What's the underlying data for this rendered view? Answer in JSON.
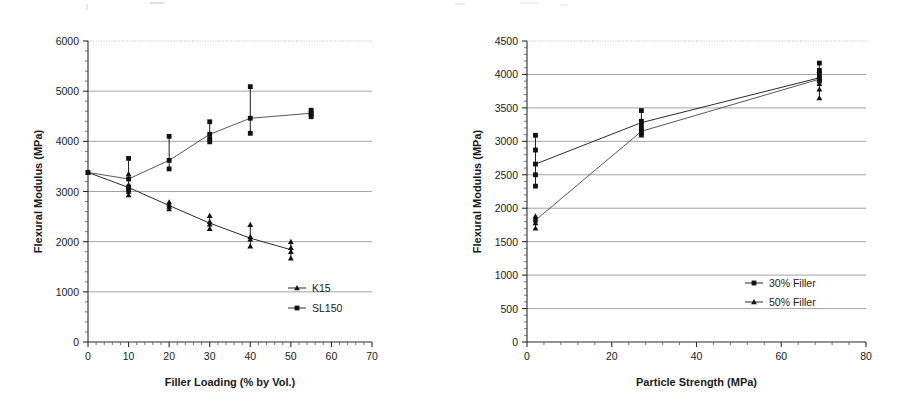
{
  "figure": {
    "panel_count": 2,
    "background": "#ffffff",
    "ink_color": "#111111",
    "grid_color": "#9a9a9a"
  },
  "chart_data": [
    {
      "id": "left",
      "type": "scatter",
      "title": "",
      "xlabel": "Filler Loading (% by Vol.)",
      "ylabel": "Flexural Modulus (MPa)",
      "xlim": [
        0,
        70
      ],
      "ylim": [
        0,
        6000
      ],
      "xticks": [
        0,
        10,
        20,
        30,
        40,
        50,
        60,
        70
      ],
      "yticks": [
        0,
        1000,
        2000,
        3000,
        4000,
        5000,
        6000
      ],
      "xtick_labels": [
        "0",
        "10",
        "20",
        "30",
        "40",
        "50",
        "60",
        "70"
      ],
      "ytick_labels": [
        "0",
        "1000",
        "2000",
        "3000",
        "4000",
        "5000",
        "6000"
      ],
      "x_minor_step": 2,
      "y_minor_step": 200,
      "grid": true,
      "legend_position": "bottom-right",
      "series": [
        {
          "name": "K15",
          "marker": "triangle",
          "mean_x": [
            0,
            10,
            20,
            30,
            40,
            50
          ],
          "mean_y": [
            3380,
            3080,
            2720,
            2370,
            2070,
            1840
          ],
          "points": [
            {
              "x": 0,
              "y": 3380
            },
            {
              "x": 10,
              "y": 3350
            },
            {
              "x": 10,
              "y": 3130
            },
            {
              "x": 10,
              "y": 3080
            },
            {
              "x": 10,
              "y": 3000
            },
            {
              "x": 10,
              "y": 2930
            },
            {
              "x": 20,
              "y": 2790
            },
            {
              "x": 20,
              "y": 2740
            },
            {
              "x": 20,
              "y": 2700
            },
            {
              "x": 20,
              "y": 2650
            },
            {
              "x": 30,
              "y": 2520
            },
            {
              "x": 30,
              "y": 2400
            },
            {
              "x": 30,
              "y": 2350
            },
            {
              "x": 30,
              "y": 2260
            },
            {
              "x": 40,
              "y": 2340
            },
            {
              "x": 40,
              "y": 2100
            },
            {
              "x": 40,
              "y": 2050
            },
            {
              "x": 40,
              "y": 1910
            },
            {
              "x": 50,
              "y": 2000
            },
            {
              "x": 50,
              "y": 1880
            },
            {
              "x": 50,
              "y": 1800
            },
            {
              "x": 50,
              "y": 1670
            }
          ],
          "error_bars": [
            {
              "x": 10,
              "low": 2930,
              "high": 3350
            },
            {
              "x": 20,
              "low": 2650,
              "high": 2790
            },
            {
              "x": 30,
              "low": 2260,
              "high": 2520
            },
            {
              "x": 40,
              "low": 1910,
              "high": 2340
            },
            {
              "x": 50,
              "low": 1670,
              "high": 2000
            }
          ]
        },
        {
          "name": "SL150",
          "marker": "square",
          "mean_x": [
            0,
            10,
            20,
            30,
            40,
            55
          ],
          "mean_y": [
            3380,
            3250,
            3620,
            4140,
            4460,
            4560
          ],
          "points": [
            {
              "x": 0,
              "y": 3380
            },
            {
              "x": 10,
              "y": 3660
            },
            {
              "x": 10,
              "y": 3250
            },
            {
              "x": 10,
              "y": 3090
            },
            {
              "x": 10,
              "y": 3040
            },
            {
              "x": 20,
              "y": 4100
            },
            {
              "x": 20,
              "y": 3620
            },
            {
              "x": 20,
              "y": 3450
            },
            {
              "x": 30,
              "y": 4390
            },
            {
              "x": 30,
              "y": 4140
            },
            {
              "x": 30,
              "y": 4050
            },
            {
              "x": 30,
              "y": 3990
            },
            {
              "x": 40,
              "y": 5090
            },
            {
              "x": 40,
              "y": 4460
            },
            {
              "x": 40,
              "y": 4160
            },
            {
              "x": 55,
              "y": 4620
            },
            {
              "x": 55,
              "y": 4570
            },
            {
              "x": 55,
              "y": 4530
            },
            {
              "x": 55,
              "y": 4490
            }
          ],
          "error_bars": [
            {
              "x": 10,
              "low": 3040,
              "high": 3660
            },
            {
              "x": 20,
              "low": 3450,
              "high": 4100
            },
            {
              "x": 30,
              "low": 3990,
              "high": 4390
            },
            {
              "x": 40,
              "low": 4160,
              "high": 5090
            },
            {
              "x": 55,
              "low": 4490,
              "high": 4620
            }
          ]
        }
      ],
      "legend": [
        {
          "label": "K15",
          "marker": "triangle"
        },
        {
          "label": "SL150",
          "marker": "square"
        }
      ]
    },
    {
      "id": "right",
      "type": "scatter",
      "title": "",
      "xlabel": "Particle Strength (MPa)",
      "ylabel": "Flexural Modulus (MPa)",
      "xlim": [
        0,
        80
      ],
      "ylim": [
        0,
        4500
      ],
      "xticks": [
        0,
        20,
        40,
        60,
        80
      ],
      "yticks": [
        0,
        500,
        1000,
        1500,
        2000,
        2500,
        3000,
        3500,
        4000,
        4500
      ],
      "xtick_labels": [
        "0",
        "20",
        "40",
        "60",
        "80"
      ],
      "ytick_labels": [
        "0",
        "500",
        "1000",
        "1500",
        "2000",
        "2500",
        "3000",
        "3500",
        "4000",
        "4500"
      ],
      "x_minor_step": 4,
      "y_minor_step": 100,
      "grid": true,
      "legend_position": "bottom-right",
      "series": [
        {
          "name": "30% Filler",
          "marker": "square",
          "mean_x": [
            2,
            27,
            69
          ],
          "mean_y": [
            2660,
            3280,
            3950
          ],
          "points": [
            {
              "x": 2,
              "y": 3090
            },
            {
              "x": 2,
              "y": 2870
            },
            {
              "x": 2,
              "y": 2660
            },
            {
              "x": 2,
              "y": 2500
            },
            {
              "x": 2,
              "y": 2330
            },
            {
              "x": 27,
              "y": 3460
            },
            {
              "x": 27,
              "y": 3300
            },
            {
              "x": 27,
              "y": 3250
            },
            {
              "x": 27,
              "y": 3180
            },
            {
              "x": 27,
              "y": 3120
            },
            {
              "x": 69,
              "y": 4170
            },
            {
              "x": 69,
              "y": 4060
            },
            {
              "x": 69,
              "y": 4000
            },
            {
              "x": 69,
              "y": 3950
            },
            {
              "x": 69,
              "y": 3900
            }
          ],
          "error_bars": [
            {
              "x": 2,
              "low": 2330,
              "high": 3090
            },
            {
              "x": 27,
              "low": 3120,
              "high": 3460
            },
            {
              "x": 69,
              "low": 3900,
              "high": 4170
            }
          ]
        },
        {
          "name": "50% Filler",
          "marker": "triangle",
          "mean_x": [
            2,
            27,
            69
          ],
          "mean_y": [
            1820,
            3150,
            3930
          ],
          "points": [
            {
              "x": 2,
              "y": 1880
            },
            {
              "x": 2,
              "y": 1850
            },
            {
              "x": 2,
              "y": 1820
            },
            {
              "x": 2,
              "y": 1780
            },
            {
              "x": 2,
              "y": 1700
            },
            {
              "x": 27,
              "y": 3200
            },
            {
              "x": 27,
              "y": 3150
            },
            {
              "x": 27,
              "y": 3120
            },
            {
              "x": 27,
              "y": 3090
            },
            {
              "x": 69,
              "y": 4060
            },
            {
              "x": 69,
              "y": 3980
            },
            {
              "x": 69,
              "y": 3930
            },
            {
              "x": 69,
              "y": 3860
            },
            {
              "x": 69,
              "y": 3780
            },
            {
              "x": 69,
              "y": 3650
            }
          ],
          "error_bars": [
            {
              "x": 2,
              "low": 1700,
              "high": 1880
            },
            {
              "x": 27,
              "low": 3090,
              "high": 3200
            },
            {
              "x": 69,
              "low": 3650,
              "high": 4060
            }
          ]
        }
      ],
      "legend": [
        {
          "label": "30% Filler",
          "marker": "square"
        },
        {
          "label": "50% Filler",
          "marker": "triangle"
        }
      ]
    }
  ]
}
